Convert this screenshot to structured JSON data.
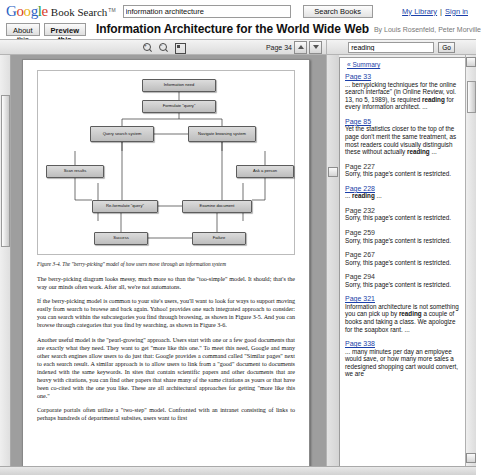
{
  "topbar": {
    "logo_word": "Google",
    "logo_suffix": "Book Search",
    "logo_tm": "TM",
    "query_value": "information architecture",
    "query_placeholder": "Search books",
    "search_button": "Search Books",
    "my_library": "My Library",
    "separator": "|",
    "sign_in": "Sign in"
  },
  "titlerow": {
    "about_tab": "About this book",
    "preview_tab": "Preview this book",
    "book_title": "Information Architecture for the World Wide Web",
    "byline": "By Louis Rosenfeld, Peter Morville"
  },
  "toolbar": {
    "zoom_in_icon": "zoom-in-icon",
    "zoom_out_icon": "zoom-out-icon",
    "fullscreen_icon": "fullscreen-icon",
    "page_label": "Page 34",
    "prev_page_icon": "page-up-icon",
    "next_page_icon": "page-down-icon",
    "side_search_value": "reading",
    "side_search_placeholder": "Search in this book",
    "go_button": "Go"
  },
  "figure": {
    "caption": "Figure 3-4. The \"berry-picking\" model of how users move through an information system",
    "nodes": [
      {
        "label": "Information need",
        "x": 104,
        "y": 8,
        "w": 74,
        "h": 13
      },
      {
        "label": "Formulate \"query\"",
        "x": 104,
        "y": 29,
        "w": 74,
        "h": 13
      },
      {
        "label": "Query search system",
        "x": 52,
        "y": 55,
        "w": 64,
        "h": 16
      },
      {
        "label": "Navigate browsing system",
        "x": 150,
        "y": 55,
        "w": 68,
        "h": 16
      },
      {
        "label": "Scan results",
        "x": 8,
        "y": 94,
        "w": 58,
        "h": 13
      },
      {
        "label": "Ask a person",
        "x": 198,
        "y": 94,
        "w": 58,
        "h": 13
      },
      {
        "label": "Re-formulate \"query\"",
        "x": 54,
        "y": 129,
        "w": 66,
        "h": 13
      },
      {
        "label": "Examine document",
        "x": 144,
        "y": 129,
        "w": 70,
        "h": 13
      },
      {
        "label": "Success",
        "x": 56,
        "y": 161,
        "w": 54,
        "h": 13
      },
      {
        "label": "Failure",
        "x": 154,
        "y": 161,
        "w": 54,
        "h": 13
      }
    ]
  },
  "page_text": {
    "paragraphs": [
      "The berry-picking diagram looks messy, much more so than the \"too-simple\" model. It should; that's the way our minds often work. After all, we're not automatons.",
      "If the berry-picking model is common to your site's users, you'll want to look for ways to support moving easily from search to browse and back again. Yahoo! provides one such integrated approach to consider: you can search within the subcategories you find through browsing, as shown in Figure 3-5. And you can browse through categories that you find by searching, as shown in Figure 3-6.",
      "Another useful model is the \"pearl-growing\" approach. Users start with one or a few good documents that are exactly what they need. They want to get \"more like this one.\" To meet this need, Google and many other search engines allow users to do just that: Google provides a command called \"Similar pages\" next to each search result. A similar approach is to allow users to link from a \"good\" document to documents indexed with the same keywords. In sites that contain scientific papers and other documents that are heavy with citations, you can find other papers that share many of the same citations as yours or that have been co-cited with the one you like. These are all architectural approaches for getting \"more like this one.\"",
      "Corporate portals often utilize a \"two-step\" model. Confronted with an intranet consisting of links to perhaps hundreds of departmental subsites, users want to first"
    ]
  },
  "results": {
    "summary_label": "« Summary",
    "items": [
      {
        "page": "Page 33",
        "linked": true,
        "snippet_pre": "... berrypicking techniques for the online search interface\" (in Online Review, vol. 13, no 5, 1989), is required ",
        "snippet_bold": "reading",
        "snippet_post": " for every information architect. ..."
      },
      {
        "page": "Page 85",
        "linked": true,
        "snippet_pre": "Yet the statistics closer to the top of the page don't merit the same treatment, as most readers could visually distinguish these without actually ",
        "snippet_bold": "reading",
        "snippet_post": " ..."
      },
      {
        "page": "Page 227",
        "linked": false,
        "snippet_pre": "Sorry, this page's content is restricted.",
        "snippet_bold": "",
        "snippet_post": ""
      },
      {
        "page": "Page 228",
        "linked": true,
        "snippet_pre": "... ",
        "snippet_bold": "reading",
        "snippet_post": " ..."
      },
      {
        "page": "Page 232",
        "linked": false,
        "snippet_pre": "Sorry, this page's content is restricted.",
        "snippet_bold": "",
        "snippet_post": ""
      },
      {
        "page": "Page 259",
        "linked": false,
        "snippet_pre": "Sorry, this page's content is restricted.",
        "snippet_bold": "",
        "snippet_post": ""
      },
      {
        "page": "Page 267",
        "linked": false,
        "snippet_pre": "Sorry, this page's content is restricted.",
        "snippet_bold": "",
        "snippet_post": ""
      },
      {
        "page": "Page 294",
        "linked": false,
        "snippet_pre": "Sorry, this page's content is restricted.",
        "snippet_bold": "",
        "snippet_post": ""
      },
      {
        "page": "Page 321",
        "linked": true,
        "snippet_pre": "Information architecture is not something you can pick up by ",
        "snippet_bold": "reading",
        "snippet_post": " a couple of books and taking a class. We apologize for the soapbox rant. ..."
      },
      {
        "page": "Page 338",
        "linked": true,
        "snippet_pre": "... many minutes per day an employee would save, or how many more sales a redesigned shopping cart would convert, we are",
        "snippet_bold": "",
        "snippet_post": ""
      }
    ]
  },
  "colors": {
    "link": "#1b3fa8",
    "chrome": "#ececec",
    "viewer_bg": "#9e9e9e"
  }
}
